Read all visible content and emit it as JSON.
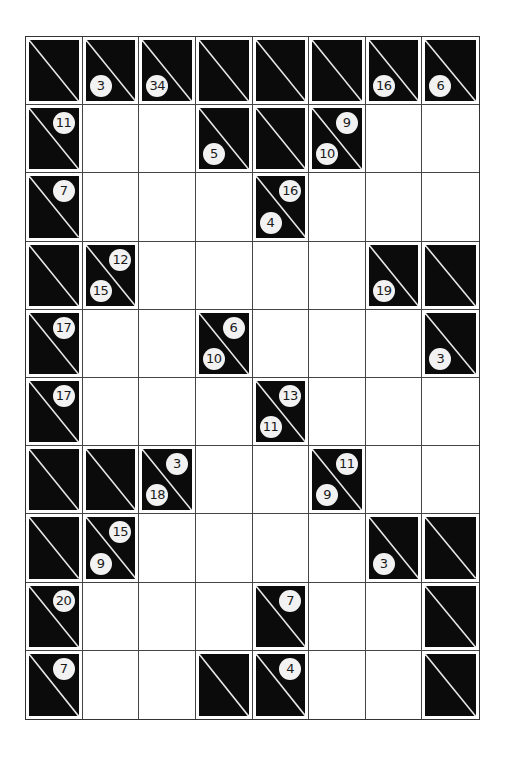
{
  "puzzle": {
    "type": "kakuro",
    "rows": 10,
    "cols": 8,
    "colors": {
      "block": "#0b0b0b",
      "white": "#ffffff",
      "clue_bg": "#f2f2f2",
      "grid_line": "#444444"
    },
    "grid": [
      [
        {
          "t": "B"
        },
        {
          "t": "B",
          "down": "3"
        },
        {
          "t": "B",
          "down": "34"
        },
        {
          "t": "B"
        },
        {
          "t": "B"
        },
        {
          "t": "B"
        },
        {
          "t": "B",
          "down": "16"
        },
        {
          "t": "B",
          "down": "6"
        }
      ],
      [
        {
          "t": "B",
          "across": "11"
        },
        {
          "t": "W"
        },
        {
          "t": "W"
        },
        {
          "t": "B",
          "down": "5"
        },
        {
          "t": "B"
        },
        {
          "t": "B",
          "down": "10",
          "across": "9"
        },
        {
          "t": "W"
        },
        {
          "t": "W"
        }
      ],
      [
        {
          "t": "B",
          "across": "7"
        },
        {
          "t": "W"
        },
        {
          "t": "W"
        },
        {
          "t": "W"
        },
        {
          "t": "B",
          "down": "4",
          "across": "16"
        },
        {
          "t": "W"
        },
        {
          "t": "W"
        },
        {
          "t": "W"
        }
      ],
      [
        {
          "t": "B"
        },
        {
          "t": "B",
          "down": "15",
          "across": "12"
        },
        {
          "t": "W"
        },
        {
          "t": "W"
        },
        {
          "t": "W"
        },
        {
          "t": "W"
        },
        {
          "t": "B",
          "down": "19"
        },
        {
          "t": "B"
        }
      ],
      [
        {
          "t": "B",
          "across": "17"
        },
        {
          "t": "W"
        },
        {
          "t": "W"
        },
        {
          "t": "B",
          "down": "10",
          "across": "6"
        },
        {
          "t": "W"
        },
        {
          "t": "W"
        },
        {
          "t": "W"
        },
        {
          "t": "B",
          "down": "3"
        }
      ],
      [
        {
          "t": "B",
          "across": "17"
        },
        {
          "t": "W"
        },
        {
          "t": "W"
        },
        {
          "t": "W"
        },
        {
          "t": "B",
          "down": "11",
          "across": "13"
        },
        {
          "t": "W"
        },
        {
          "t": "W"
        },
        {
          "t": "W"
        }
      ],
      [
        {
          "t": "B"
        },
        {
          "t": "B"
        },
        {
          "t": "B",
          "down": "18",
          "across": "3"
        },
        {
          "t": "W"
        },
        {
          "t": "W"
        },
        {
          "t": "B",
          "down": "9",
          "across": "11"
        },
        {
          "t": "W"
        },
        {
          "t": "W"
        }
      ],
      [
        {
          "t": "B"
        },
        {
          "t": "B",
          "down": "9",
          "across": "15"
        },
        {
          "t": "W"
        },
        {
          "t": "W"
        },
        {
          "t": "W"
        },
        {
          "t": "W"
        },
        {
          "t": "B",
          "down": "3"
        },
        {
          "t": "B"
        }
      ],
      [
        {
          "t": "B",
          "across": "20"
        },
        {
          "t": "W"
        },
        {
          "t": "W"
        },
        {
          "t": "W"
        },
        {
          "t": "B",
          "across": "7"
        },
        {
          "t": "W"
        },
        {
          "t": "W"
        },
        {
          "t": "B"
        }
      ],
      [
        {
          "t": "B",
          "across": "7"
        },
        {
          "t": "W"
        },
        {
          "t": "W"
        },
        {
          "t": "B"
        },
        {
          "t": "B",
          "across": "4"
        },
        {
          "t": "W"
        },
        {
          "t": "W"
        },
        {
          "t": "B"
        }
      ]
    ]
  }
}
